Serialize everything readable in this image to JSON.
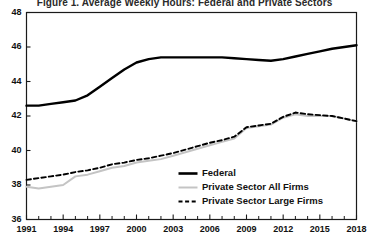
{
  "chart_data": {
    "type": "line",
    "title": "Figure 1. Average Weekly Hours: Federal and Private Sectors",
    "xlabel": "",
    "ylabel": "",
    "xlim": [
      1991,
      2018
    ],
    "ylim": [
      36,
      48
    ],
    "y_ticks": [
      36,
      38,
      40,
      42,
      44,
      46,
      48
    ],
    "x_ticks": [
      1991,
      1994,
      1997,
      2000,
      2003,
      2006,
      2009,
      2012,
      2015,
      2018
    ],
    "x_tick_labels": [
      "1991",
      "1994",
      "1997",
      "2000",
      "2003",
      "2006",
      "2009",
      "2012",
      "2015",
      "2018"
    ],
    "y_tick_labels": [
      "36",
      "38",
      "40",
      "42",
      "44",
      "46",
      "48"
    ],
    "grid": false,
    "legend_position": "inside lower right",
    "x": [
      1991,
      1992,
      1993,
      1994,
      1995,
      1996,
      1997,
      1998,
      1999,
      2000,
      2001,
      2002,
      2003,
      2004,
      2005,
      2006,
      2007,
      2008,
      2009,
      2010,
      2011,
      2012,
      2013,
      2014,
      2015,
      2016,
      2017,
      2018
    ],
    "series": [
      {
        "name": "Federal",
        "style": "solid-thick-black",
        "color": "#000000",
        "values": [
          42.6,
          42.6,
          42.7,
          42.8,
          42.9,
          43.2,
          43.7,
          44.2,
          44.7,
          45.1,
          45.3,
          45.4,
          45.4,
          45.4,
          45.4,
          45.4,
          45.4,
          45.35,
          45.3,
          45.25,
          45.2,
          45.3,
          45.45,
          45.6,
          45.75,
          45.9,
          46.0,
          46.1
        ]
      },
      {
        "name": "Private Sector All Firms",
        "style": "solid-thin-gray",
        "color": "#c4c4c4",
        "values": [
          37.9,
          37.8,
          37.9,
          38.0,
          38.5,
          38.6,
          38.8,
          39.0,
          39.1,
          39.3,
          39.4,
          39.5,
          39.7,
          39.9,
          40.1,
          40.3,
          40.5,
          40.7,
          41.3,
          41.4,
          41.5,
          41.9,
          42.1,
          42.0,
          42.0,
          42.0,
          41.85,
          41.7
        ]
      },
      {
        "name": "Private Sector Large Firms",
        "style": "dashed-black",
        "color": "#000000",
        "values": [
          38.3,
          38.4,
          38.5,
          38.6,
          38.75,
          38.85,
          39.0,
          39.2,
          39.3,
          39.45,
          39.55,
          39.7,
          39.85,
          40.05,
          40.25,
          40.45,
          40.6,
          40.8,
          41.35,
          41.45,
          41.55,
          41.95,
          42.2,
          42.1,
          42.05,
          42.0,
          41.85,
          41.7
        ]
      }
    ]
  },
  "axes": {
    "frame_color": "#1a1a1a"
  }
}
